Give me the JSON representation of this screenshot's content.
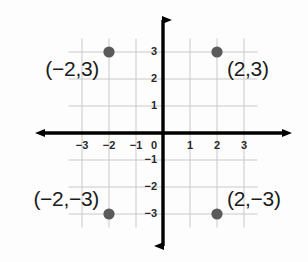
{
  "figure": {
    "background_color": "#fdfdfd",
    "axis_color": "#000000",
    "grid_color": "#c9c9c9",
    "point_color": "#5a5a5a",
    "label_color": "#1b1b1b"
  },
  "chart_data": {
    "type": "scatter",
    "title": "",
    "xlabel": "",
    "ylabel": "",
    "xlim": [
      -3.6,
      3.6
    ],
    "ylim": [
      -3.6,
      3.6
    ],
    "grid": true,
    "legend": null,
    "x_ticks": [
      -3,
      -2,
      -1,
      0,
      1,
      2,
      3
    ],
    "y_ticks": [
      3,
      2,
      1,
      0,
      -1,
      -2,
      -3
    ],
    "x_tick_labels": [
      "-3",
      "-2",
      "-1",
      "0",
      "1",
      "2",
      "3"
    ],
    "y_tick_labels": [
      "3",
      "2",
      "1",
      "0",
      "-1",
      "-2",
      "-3"
    ],
    "origin_label": "0",
    "points": [
      {
        "x": -2,
        "y": 3,
        "label": "(−2,3)",
        "label_side": "left"
      },
      {
        "x": 2,
        "y": 3,
        "label": "(2,3)",
        "label_side": "right"
      },
      {
        "x": -2,
        "y": -3,
        "label": "(−2,−3)",
        "label_side": "left"
      },
      {
        "x": 2,
        "y": -3,
        "label": "(2,−3)",
        "label_side": "right"
      }
    ]
  },
  "ticks": {
    "x": [
      {
        "value": -3,
        "text": "−3"
      },
      {
        "value": -2,
        "text": "−2"
      },
      {
        "value": -1,
        "text": "−1"
      },
      {
        "value": 1,
        "text": "1"
      },
      {
        "value": 2,
        "text": "2"
      },
      {
        "value": 3,
        "text": "3"
      }
    ],
    "y": [
      {
        "value": 3,
        "text": "3"
      },
      {
        "value": 2,
        "text": "2"
      },
      {
        "value": 1,
        "text": "1"
      },
      {
        "value": -1,
        "text": "−1"
      },
      {
        "value": -2,
        "text": "−2"
      },
      {
        "value": -3,
        "text": "−3"
      }
    ],
    "origin": {
      "text": "0"
    }
  },
  "labels": {
    "top_left": "(−2,3)",
    "top_right": "(2,3)",
    "bottom_left": "(−2,−3)",
    "bottom_right": "(2,−3)"
  }
}
